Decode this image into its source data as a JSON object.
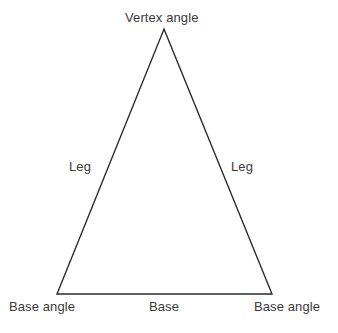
{
  "diagram": {
    "type": "isosceles-triangle-labeled",
    "background_color": "#ffffff",
    "stroke_color": "#2b2b2b",
    "text_color": "#3b3b3b",
    "stroke_width": 1.4,
    "vertices": {
      "apex": {
        "x": 164,
        "y": 29
      },
      "bottom_left": {
        "x": 57,
        "y": 294
      },
      "bottom_right": {
        "x": 272,
        "y": 294
      }
    },
    "labels": {
      "vertex_angle": "Vertex angle",
      "leg_left": "Leg",
      "leg_right": "Leg",
      "base_angle_left": "Base angle",
      "base": "Base",
      "base_angle_right": "Base angle"
    }
  }
}
